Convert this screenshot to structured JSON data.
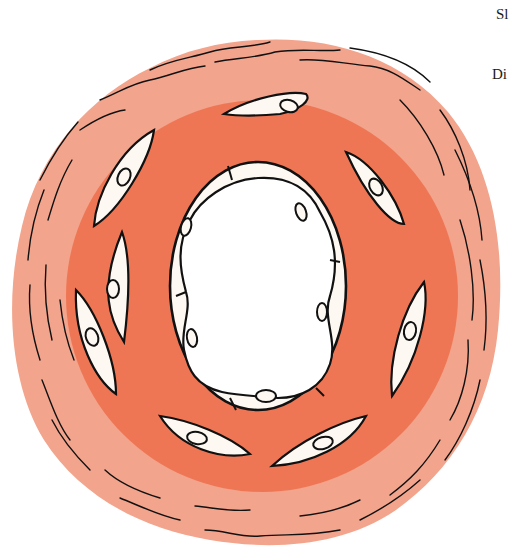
{
  "figure": {
    "colors": {
      "background": "#ffffff",
      "adventitia": "#f2a48c",
      "media": "#ee7654",
      "cell_fill": "#fdf8f2",
      "lumen": "#ffffff",
      "outline": "#111111"
    },
    "labels": [
      {
        "text": "Sl",
        "x": 496,
        "y": 6
      },
      {
        "text": "Di",
        "x": 492,
        "y": 66
      }
    ]
  }
}
